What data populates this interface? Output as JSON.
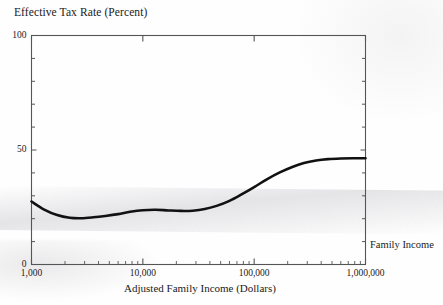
{
  "figure": {
    "title": "Effective Tax Rate (Percent)",
    "x_axis_title": "Adjusted Family Income (Dollars)",
    "right_axis_label": "Family Income",
    "line_color": "#111111",
    "axis_color": "#555555",
    "background": "#fefefe"
  },
  "axes": {
    "y_tick_labels": [
      {
        "value": 100,
        "text": "100"
      },
      {
        "value": 50,
        "text": "50"
      },
      {
        "value": 0,
        "text": "0"
      }
    ],
    "x_tick_labels": [
      {
        "value": 1000,
        "text": "1,000"
      },
      {
        "value": 10000,
        "text": "10,000"
      },
      {
        "value": 100000,
        "text": "100,000"
      },
      {
        "value": 1000000,
        "text": "1,000,000"
      }
    ]
  },
  "chart_data": {
    "type": "line",
    "title": "Effective Tax Rate (Percent)",
    "xlabel": "Adjusted Family Income (Dollars)",
    "ylabel": "Effective Tax Rate (Percent)",
    "xscale": "log",
    "yscale": "linear",
    "xlim": [
      1000,
      1000000
    ],
    "ylim": [
      0,
      100
    ],
    "grid": false,
    "legend": null,
    "y_major_ticks": [
      0,
      50,
      100
    ],
    "y_minor_tick_interval": 10,
    "x_major_ticks": [
      1000,
      10000,
      100000,
      1000000
    ],
    "x_minor_ticks_per_decade": [
      2,
      3,
      4,
      5,
      6,
      7,
      8,
      9
    ],
    "series": [
      {
        "name": "Effective tax rate",
        "x": [
          1000,
          1300,
          1700,
          2200,
          2800,
          3600,
          4600,
          6000,
          7700,
          10000,
          13000,
          17000,
          22000,
          28000,
          36000,
          46000,
          60000,
          77000,
          100000,
          130000,
          170000,
          220000,
          280000,
          360000,
          460000,
          600000,
          770000,
          1000000
        ],
        "y": [
          27.5,
          24.0,
          21.6,
          20.4,
          20.2,
          20.6,
          21.2,
          22.0,
          23.0,
          23.7,
          23.9,
          23.6,
          23.4,
          23.5,
          24.2,
          25.6,
          27.8,
          30.6,
          33.8,
          37.2,
          40.2,
          42.6,
          44.3,
          45.4,
          46.0,
          46.3,
          46.4,
          46.4
        ]
      }
    ]
  }
}
